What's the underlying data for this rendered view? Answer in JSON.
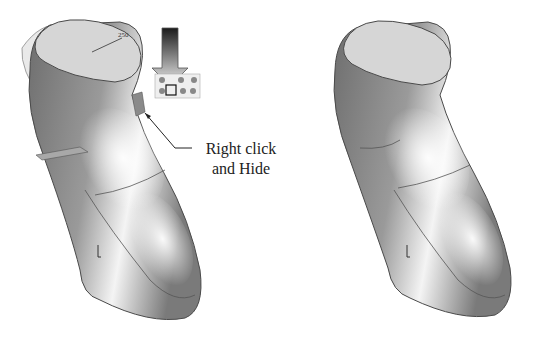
{
  "figure": {
    "left_model": {
      "label": "grip-model-before",
      "dimension_label": "250",
      "toolbar": {
        "name": "context-toolbar",
        "selected_icon": "hide-icon"
      },
      "arrow": "down-arrow-indicator"
    },
    "callout": {
      "line1": "Right click",
      "line2": "and Hide"
    },
    "right_model": {
      "label": "grip-model-after"
    }
  },
  "colors": {
    "background": "#ffffff",
    "model_dark": "#6e6e6e",
    "model_mid": "#9a9a9a",
    "model_light": "#f4f4f4",
    "top_face": "#d6d6d6",
    "surface_translucent": "#e6e6e6",
    "outline": "#4a4a4a",
    "text": "#222222"
  }
}
